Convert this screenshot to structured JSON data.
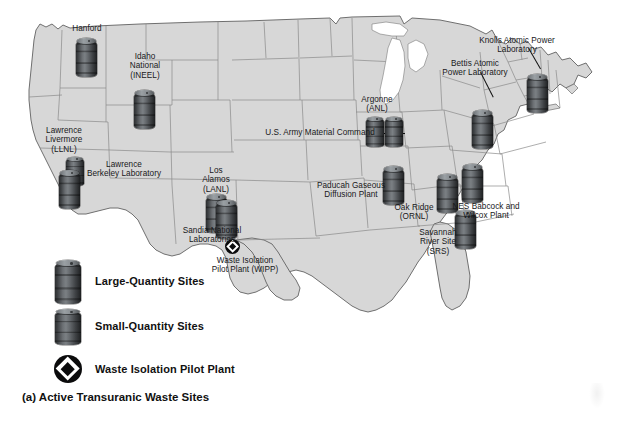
{
  "figure": {
    "caption": "(a) Active Transuranic Waste Sites",
    "land_color": "#d6d6d6",
    "border_color": "#6f6f6f",
    "barrel_color": "#4a4d50",
    "marker_color": "#000000"
  },
  "legend": {
    "items": [
      {
        "icon": "barrel-large-icon",
        "label": "Large-Quantity Sites"
      },
      {
        "icon": "barrel-small-icon",
        "label": "Small-Quantity Sites"
      },
      {
        "icon": "wipp-diamond-icon",
        "label": "Waste Isolation Pilot Plant"
      }
    ]
  },
  "sites": [
    {
      "id": "hanford",
      "label": "Hanford",
      "size": "large",
      "leader": false
    },
    {
      "id": "ineel",
      "label": "Idaho\nNational\n(INEEL)",
      "size": "large",
      "leader": false
    },
    {
      "id": "llnl",
      "label": "Lawrence\nLivermore\n(LLNL)",
      "size": "small",
      "leader": false
    },
    {
      "id": "lbl",
      "label": "Lawrence\nBerkeley Laboratory",
      "size": "large",
      "leader": false
    },
    {
      "id": "lanl",
      "label": "Los\nAlamos\n(LANL)",
      "size": "large",
      "leader": false
    },
    {
      "id": "sandia",
      "label": "Sandia National\nLaboratories",
      "size": "large",
      "leader": false
    },
    {
      "id": "army",
      "label": "U.S. Army Material Command",
      "size": "small",
      "leader": false
    },
    {
      "id": "anl",
      "label": "Argonne\n(ANL)",
      "size": "small",
      "leader": false
    },
    {
      "id": "bettis",
      "label": "Bettis Atomic\nPower Laboratory",
      "size": "large",
      "leader": true
    },
    {
      "id": "knolls",
      "label": "Knolls Atomic Power\nLaboratory",
      "size": "large",
      "leader": true
    },
    {
      "id": "paducah",
      "label": "Paducah Gaseous\nDiffusion Plant",
      "size": "large",
      "leader": false
    },
    {
      "id": "ornl",
      "label": "Oak Ridge\n(ORNL)",
      "size": "large",
      "leader": false
    },
    {
      "id": "nes",
      "label": "NES Babcock and\nWilcox Plant",
      "size": "large",
      "leader": false
    },
    {
      "id": "srs",
      "label": "Savannah\nRiver Site\n(SRS)",
      "size": "large",
      "leader": false
    },
    {
      "id": "wipp",
      "label": "Waste Isolation\nPilot Plant (WIPP)",
      "size": "marker",
      "leader": false
    }
  ]
}
